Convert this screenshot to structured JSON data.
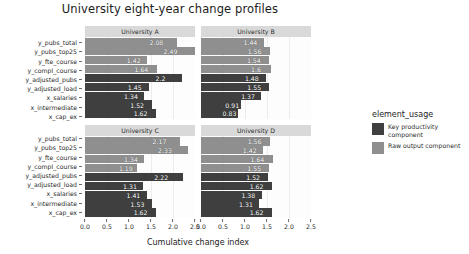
{
  "chart_data": {
    "type": "bar",
    "title": "University eight-year change profiles",
    "xlabel": "Cumulative change index",
    "ylabel": "",
    "xlim": [
      0,
      2.5
    ],
    "xticks": [
      "0.0",
      "0.5",
      "1.0",
      "1.5",
      "2.0",
      "2.5"
    ],
    "xtick_values": [
      0,
      0.5,
      1.0,
      1.5,
      2.0,
      2.5
    ],
    "grid": true,
    "orientation": "horizontal",
    "legend_position": "right",
    "legend_title": "element_usage",
    "categories": [
      "y_pubs_total",
      "y_pubs_top25",
      "y_fte_course",
      "y_compl_course",
      "y_adjusted_pubs",
      "y_adjusted_load",
      "x_salaries",
      "x_intermediate",
      "x_cap_ex"
    ],
    "group_by_category": [
      "Raw output component",
      "Raw output component",
      "Raw output component",
      "Raw output component",
      "Key productivity component",
      "Key productivity component",
      "Key productivity component",
      "Key productivity component",
      "Key productivity component"
    ],
    "colors": {
      "Key productivity component": "#3f3f3f",
      "Raw output component": "#8f8f8f"
    },
    "facets": [
      {
        "label": "University A",
        "values": [
          2.08,
          2.49,
          1.42,
          1.64,
          2.2,
          1.45,
          1.34,
          1.52,
          1.62
        ],
        "value_labels": [
          "2.08",
          "2.49",
          "1.42",
          "1.64",
          "2.2",
          "1.45",
          "1.34",
          "1.52",
          "1.62"
        ]
      },
      {
        "label": "University B",
        "values": [
          1.44,
          1.56,
          1.54,
          1.6,
          1.48,
          1.55,
          1.37,
          0.91,
          0.83
        ],
        "value_labels": [
          "1.44",
          "1.56",
          "1.54",
          "1.6",
          "1.48",
          "1.55",
          "1.37",
          "0.91",
          "0.83"
        ]
      },
      {
        "label": "University C",
        "values": [
          2.17,
          2.33,
          1.34,
          1.19,
          2.22,
          1.31,
          1.41,
          1.53,
          1.62
        ],
        "value_labels": [
          "2.17",
          "2.33",
          "1.34",
          "1.19",
          "2.22",
          "1.31",
          "1.41",
          "1.53",
          "1.62"
        ]
      },
      {
        "label": "University D",
        "values": [
          1.56,
          1.42,
          1.64,
          1.55,
          1.52,
          1.62,
          1.38,
          1.31,
          1.62
        ],
        "value_labels": [
          "1.56",
          "1.42",
          "1.64",
          "1.55",
          "1.52",
          "1.62",
          "1.38",
          "1.31",
          "1.62"
        ]
      }
    ],
    "legend_entries": [
      {
        "label": "Key productivity component",
        "color": "#3f3f3f"
      },
      {
        "label": "Raw output component",
        "color": "#8f8f8f"
      }
    ]
  }
}
